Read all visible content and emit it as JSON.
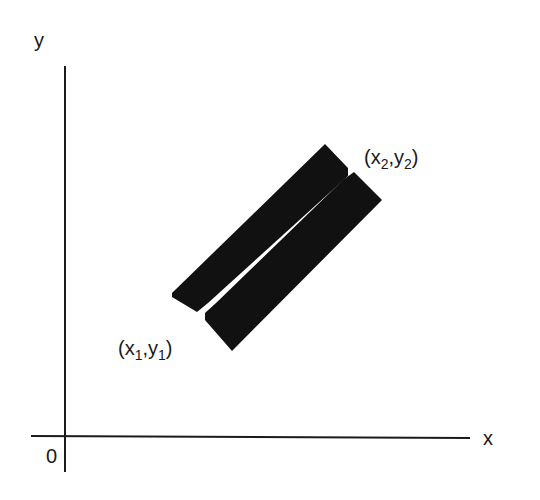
{
  "diagram": {
    "axes": {
      "x_label": "x",
      "y_label": "y",
      "origin_label": "0",
      "color": "#1a1a1a"
    },
    "bars": {
      "count": 2,
      "fill": "#111111",
      "description": "Two parallel dark rectangular strips oriented diagonally, separated by a thin white gap"
    },
    "points": [
      {
        "name": "start",
        "x": "x",
        "x_sub": "1",
        "y": "y",
        "y_sub": "1"
      },
      {
        "name": "end",
        "x": "x",
        "x_sub": "2",
        "y": "y",
        "y_sub": "2"
      }
    ]
  }
}
